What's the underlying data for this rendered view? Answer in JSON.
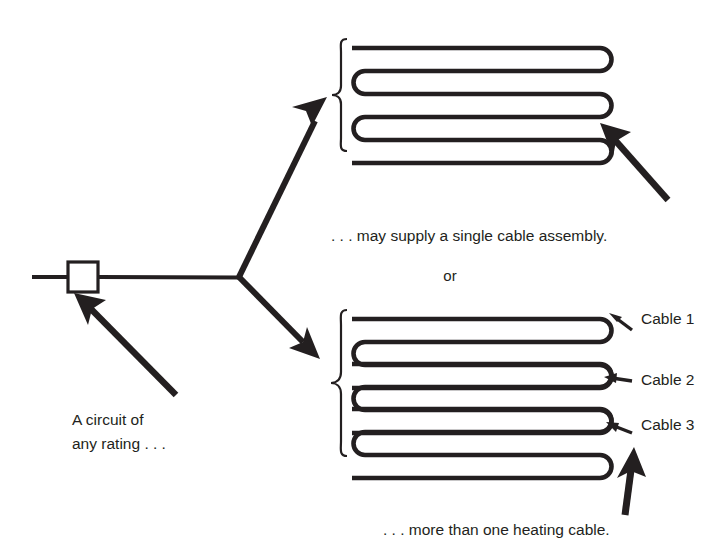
{
  "figure": {
    "type": "schematic-diagram",
    "background_color": "#ffffff",
    "line_color": "#231f20"
  },
  "captions": {
    "circuit_line1": "A circuit of",
    "circuit_line2": "any rating . . .",
    "single_assembly": ". . . may supply a single  cable assembly.",
    "or": "or",
    "more_than_one": ". . . more than one  heating cable."
  },
  "cable_labels": [
    {
      "text": "Cable 1"
    },
    {
      "text": "Cable 2"
    },
    {
      "text": "Cable 3"
    }
  ],
  "circuit": {
    "breaker_symbol": "square-box",
    "feeder_label": ""
  },
  "upper_assembly": {
    "name": "single cable assembly",
    "passes": 6,
    "left_turns": 3,
    "right_turns": 4
  },
  "lower_assembly": {
    "name": "three separate heating cables",
    "cables": 3,
    "passes_per_cable": 3
  },
  "arrows": [
    {
      "name": "circuit-callout-arrow",
      "points_to": "breaker-box"
    },
    {
      "name": "upper-branch-arrow",
      "points_to": "upper-cable-assembly"
    },
    {
      "name": "lower-branch-arrow",
      "points_to": "lower-cable-assembly"
    },
    {
      "name": "upper-assembly-callout-arrow",
      "points_to": "upper-cable-assembly"
    },
    {
      "name": "lower-assembly-callout-arrow",
      "points_to": "lower-cable-assembly"
    }
  ]
}
